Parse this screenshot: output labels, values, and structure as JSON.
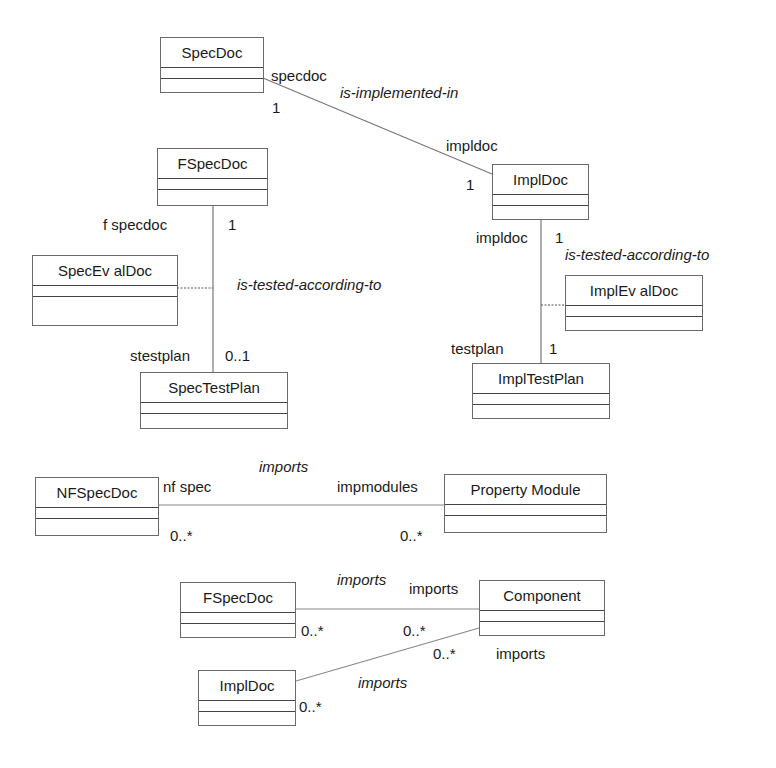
{
  "classes": {
    "specdoc": {
      "name": "SpecDoc"
    },
    "fspecdoc_top": {
      "name": "FSpecDoc"
    },
    "impldoc_top": {
      "name": "ImplDoc"
    },
    "specevaldoc": {
      "name": "SpecEv alDoc"
    },
    "implevaldoc": {
      "name": "ImplEv alDoc"
    },
    "spectestplan": {
      "name": "SpecTestPlan"
    },
    "impltestplan": {
      "name": "ImplTestPlan"
    },
    "nfspecdoc": {
      "name": "NFSpecDoc"
    },
    "propertymodule": {
      "name": "Property Module"
    },
    "fspecdoc_bottom": {
      "name": "FSpecDoc"
    },
    "component": {
      "name": "Component"
    },
    "impldoc_bottom": {
      "name": "ImplDoc"
    }
  },
  "associations": {
    "is_implemented_in": {
      "name": "is-implemented-in",
      "role_a": "specdoc",
      "mult_a": "1",
      "role_b": "impldoc",
      "mult_b": "1"
    },
    "spec_tested": {
      "name": "is-tested-according-to",
      "role_a": "f specdoc",
      "mult_a": "1",
      "role_b": "stestplan",
      "mult_b": "0..1"
    },
    "impl_tested": {
      "name": "is-tested-according-to",
      "role_a": "impldoc",
      "mult_a": "1",
      "role_b": "testplan",
      "mult_b": "1"
    },
    "nf_imports": {
      "name": "imports",
      "role_a": "nf spec",
      "mult_a": "0..*",
      "role_b": "impmodules",
      "mult_b": "0..*"
    },
    "fspec_imports": {
      "name": "imports",
      "role_b": "imports",
      "mult_a": "0..*",
      "mult_b": "0..*"
    },
    "impl_imports": {
      "name": "imports",
      "role_b": "imports",
      "mult_a": "0..*",
      "mult_b": "0..*"
    }
  }
}
